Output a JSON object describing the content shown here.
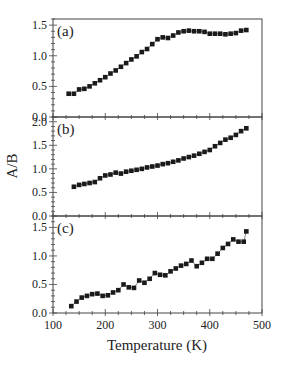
{
  "chart_data": {
    "type": "scatter",
    "layout": "three vertically stacked panels sharing x-axis",
    "xlabel": "Temperature (K)",
    "ylabel": "A/B",
    "xlim": [
      100,
      500
    ],
    "xticks": [
      100,
      200,
      300,
      400,
      500
    ],
    "x_minor_step": 25,
    "grid": false,
    "legend": null,
    "marker": "filled square",
    "marker_color": "#1a1a1a",
    "panels": [
      {
        "label": "(a)",
        "ylim": [
          0.0,
          1.6
        ],
        "yticks": [
          0.0,
          0.5,
          1.0,
          1.5
        ],
        "ytick_labels": [
          "0.0",
          "0.5",
          "1.0",
          "1.5"
        ],
        "x": [
          130,
          140,
          150,
          160,
          170,
          180,
          190,
          200,
          210,
          220,
          230,
          240,
          250,
          260,
          270,
          280,
          290,
          300,
          310,
          320,
          330,
          340,
          350,
          360,
          370,
          380,
          390,
          400,
          410,
          420,
          430,
          440,
          450,
          460,
          470
        ],
        "y": [
          0.38,
          0.38,
          0.45,
          0.46,
          0.5,
          0.55,
          0.6,
          0.65,
          0.71,
          0.76,
          0.82,
          0.88,
          0.94,
          0.99,
          1.06,
          1.11,
          1.19,
          1.27,
          1.3,
          1.29,
          1.33,
          1.38,
          1.4,
          1.41,
          1.4,
          1.4,
          1.39,
          1.36,
          1.36,
          1.36,
          1.35,
          1.36,
          1.37,
          1.41,
          1.42
        ]
      },
      {
        "label": "(b)",
        "ylim": [
          0.0,
          2.1
        ],
        "yticks": [
          0.0,
          0.5,
          1.0,
          1.5,
          2.0
        ],
        "ytick_labels": [
          "0.0",
          "0.5",
          "1.0",
          "1.5",
          "2.0"
        ],
        "x": [
          140,
          150,
          160,
          170,
          180,
          190,
          200,
          210,
          220,
          230,
          240,
          250,
          260,
          270,
          280,
          290,
          300,
          310,
          320,
          330,
          340,
          350,
          360,
          370,
          380,
          390,
          400,
          410,
          420,
          430,
          440,
          450,
          460,
          470
        ],
        "y": [
          0.62,
          0.66,
          0.68,
          0.7,
          0.72,
          0.8,
          0.86,
          0.88,
          0.92,
          0.9,
          0.94,
          0.96,
          0.98,
          1.0,
          1.03,
          1.05,
          1.07,
          1.1,
          1.12,
          1.15,
          1.18,
          1.22,
          1.25,
          1.28,
          1.32,
          1.36,
          1.4,
          1.48,
          1.55,
          1.62,
          1.66,
          1.72,
          1.8,
          1.86
        ]
      },
      {
        "label": "(c)",
        "ylim": [
          0.0,
          1.7
        ],
        "yticks": [
          0.0,
          0.5,
          1.0,
          1.5
        ],
        "ytick_labels": [
          "0.0",
          "0.5",
          "1.0",
          "1.5"
        ],
        "x": [
          135,
          145,
          155,
          165,
          175,
          185,
          195,
          205,
          215,
          225,
          235,
          245,
          255,
          265,
          275,
          285,
          295,
          305,
          315,
          325,
          335,
          345,
          355,
          365,
          375,
          385,
          395,
          405,
          415,
          425,
          435,
          445,
          455,
          465,
          470
        ],
        "y": [
          0.12,
          0.2,
          0.27,
          0.3,
          0.33,
          0.34,
          0.3,
          0.31,
          0.36,
          0.4,
          0.5,
          0.45,
          0.44,
          0.57,
          0.53,
          0.6,
          0.7,
          0.67,
          0.66,
          0.73,
          0.78,
          0.83,
          0.86,
          0.92,
          0.82,
          0.88,
          0.95,
          0.95,
          1.04,
          1.14,
          1.21,
          1.29,
          1.25,
          1.25,
          1.43
        ]
      }
    ],
    "xtick_labels": [
      "100",
      "200",
      "300",
      "400",
      "500"
    ]
  }
}
